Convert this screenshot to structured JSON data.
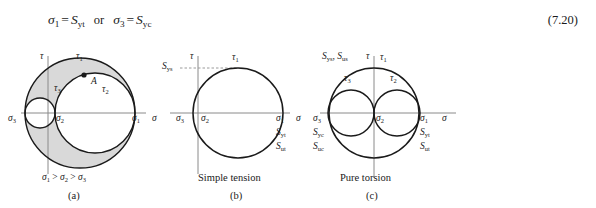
{
  "equation": {
    "lhs1": "σ",
    "lhs1_sub": "1",
    "eq": "=",
    "rhs1": "S",
    "rhs1_sub": "yt",
    "or": "or",
    "lhs2": "σ",
    "lhs2_sub": "3",
    "rhs2": "S",
    "rhs2_sub": "yc",
    "number": "(7.20)"
  },
  "figure": {
    "panels": [
      {
        "id": "a",
        "letter": "(a)",
        "caption": "σ1 > σ2 > σ3",
        "caption_parts": [
          "σ",
          "1",
          " > ",
          "σ",
          "2",
          " > ",
          "σ",
          "3"
        ],
        "axis_tau": "τ",
        "axis_sigma": "σ",
        "point_label": "A",
        "labels": [
          {
            "name": "tau-1",
            "text": "τ",
            "sub": "1"
          },
          {
            "name": "tau-2",
            "text": "τ",
            "sub": "2"
          },
          {
            "name": "tau-3",
            "text": "τ",
            "sub": "3"
          },
          {
            "name": "sigma-1",
            "text": "σ",
            "sub": "1"
          },
          {
            "name": "sigma-2",
            "text": "σ",
            "sub": "2"
          },
          {
            "name": "sigma-3",
            "text": "σ",
            "sub": "3"
          }
        ]
      },
      {
        "id": "b",
        "letter": "(b)",
        "caption": "Simple tension",
        "axis_tau": "τ",
        "axis_sigma": "σ",
        "labels": [
          {
            "name": "tau-1",
            "text": "τ",
            "sub": "1"
          },
          {
            "name": "sigma-1",
            "text": "σ",
            "sub": "1"
          },
          {
            "name": "sigma-2",
            "text": "σ",
            "sub": "2"
          },
          {
            "name": "sigma-3",
            "text": "σ",
            "sub": "3"
          },
          {
            "name": "strength-sys",
            "text": "S",
            "sub": "ys"
          },
          {
            "name": "strength-syt",
            "text": "S",
            "sub": "yt"
          },
          {
            "name": "strength-sut",
            "text": "S",
            "sub": "ut"
          }
        ]
      },
      {
        "id": "c",
        "letter": "(c)",
        "caption": "Pure torsion",
        "axis_tau": "τ",
        "axis_sigma": "σ",
        "top_label": "S ys , S us",
        "labels": [
          {
            "name": "tau-1",
            "text": "τ",
            "sub": "1"
          },
          {
            "name": "tau-2",
            "text": "τ",
            "sub": "2"
          },
          {
            "name": "tau-3",
            "text": "τ",
            "sub": "3"
          },
          {
            "name": "sigma-1",
            "text": "σ",
            "sub": "1"
          },
          {
            "name": "sigma-2",
            "text": "σ",
            "sub": "2"
          },
          {
            "name": "sigma-3",
            "text": "σ",
            "sub": "3"
          },
          {
            "name": "strength-sys",
            "text": "S",
            "sub": "ys"
          },
          {
            "name": "strength-sus",
            "text": "S",
            "sub": "us"
          },
          {
            "name": "strength-syt",
            "text": "S",
            "sub": "yt"
          },
          {
            "name": "strength-sut",
            "text": "S",
            "sub": "ut"
          },
          {
            "name": "strength-syc",
            "text": "S",
            "sub": "yc"
          },
          {
            "name": "strength-suc",
            "text": "S",
            "sub": "uc"
          }
        ]
      }
    ]
  },
  "colors": {
    "ink": "#1a1a1a",
    "axis": "#8a8a8a",
    "shade": "#d9d9d9",
    "dashed": "#9a9a9a"
  }
}
